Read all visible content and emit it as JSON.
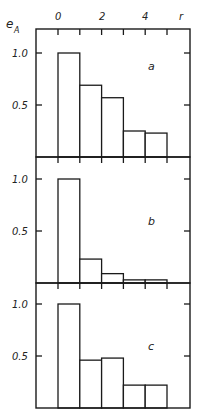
{
  "chart_data": {
    "type": "bar",
    "title": "",
    "xlabel": "r",
    "ylabel": "e_A",
    "x_ticks": [
      "0",
      "2",
      "4"
    ],
    "bin_edges": [
      0,
      1,
      2,
      3,
      4,
      5
    ],
    "categories": [
      "0-1",
      "1-2",
      "2-3",
      "3-4",
      "4-5"
    ],
    "ylim": [
      0,
      1.2
    ],
    "y_ticks": [
      "0.5",
      "1.0"
    ],
    "grid": false,
    "panels": [
      {
        "name": "a",
        "values": [
          1.0,
          0.69,
          0.57,
          0.25,
          0.23
        ]
      },
      {
        "name": "b",
        "values": [
          1.0,
          0.23,
          0.09,
          0.03,
          0.03
        ]
      },
      {
        "name": "c",
        "values": [
          1.0,
          0.46,
          0.48,
          0.22,
          0.22
        ]
      }
    ]
  },
  "axis": {
    "x_label": "r",
    "y_label_main": "e",
    "y_label_sub": "A",
    "x_tick_labels": [
      "0",
      "2",
      "4"
    ],
    "y_tick_labels": [
      "1.0",
      "0.5"
    ]
  }
}
